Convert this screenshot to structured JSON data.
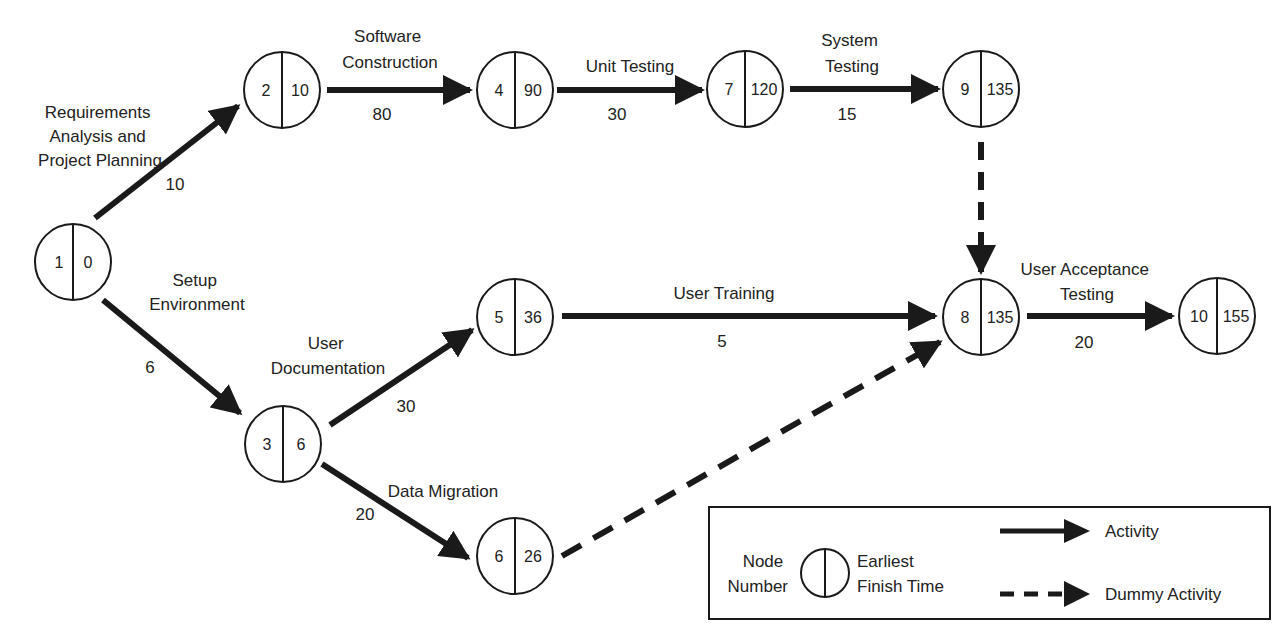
{
  "colors": {
    "ink": "#1a1a1a",
    "background": "#ffffff"
  },
  "nodes": [
    {
      "id": "1",
      "number": "1",
      "eft": "0"
    },
    {
      "id": "2",
      "number": "2",
      "eft": "10"
    },
    {
      "id": "3",
      "number": "3",
      "eft": "6"
    },
    {
      "id": "4",
      "number": "4",
      "eft": "90"
    },
    {
      "id": "5",
      "number": "5",
      "eft": "36"
    },
    {
      "id": "6",
      "number": "6",
      "eft": "26"
    },
    {
      "id": "7",
      "number": "7",
      "eft": "120"
    },
    {
      "id": "8",
      "number": "8",
      "eft": "135"
    },
    {
      "id": "9",
      "number": "9",
      "eft": "135"
    },
    {
      "id": "10",
      "number": "10",
      "eft": "155"
    }
  ],
  "activities": [
    {
      "from": "1",
      "to": "2",
      "label_lines": [
        "Requirements",
        "Analysis and",
        "Project Planning"
      ],
      "duration": "10",
      "type": "activity"
    },
    {
      "from": "1",
      "to": "3",
      "label_lines": [
        "Setup",
        "Environment"
      ],
      "duration": "6",
      "type": "activity"
    },
    {
      "from": "2",
      "to": "4",
      "label_lines": [
        "Software",
        "Construction"
      ],
      "duration": "80",
      "type": "activity"
    },
    {
      "from": "4",
      "to": "7",
      "label_lines": [
        "Unit Testing"
      ],
      "duration": "30",
      "type": "activity"
    },
    {
      "from": "7",
      "to": "9",
      "label_lines": [
        "System",
        "Testing"
      ],
      "duration": "15",
      "type": "activity"
    },
    {
      "from": "9",
      "to": "8",
      "label_lines": [],
      "duration": "",
      "type": "dummy"
    },
    {
      "from": "3",
      "to": "5",
      "label_lines": [
        "User",
        "Documentation"
      ],
      "duration": "30",
      "type": "activity"
    },
    {
      "from": "3",
      "to": "6",
      "label_lines": [
        "Data Migration"
      ],
      "duration": "20",
      "type": "activity"
    },
    {
      "from": "5",
      "to": "8",
      "label_lines": [
        "User Training"
      ],
      "duration": "5",
      "type": "activity"
    },
    {
      "from": "6",
      "to": "8",
      "label_lines": [],
      "duration": "",
      "type": "dummy"
    },
    {
      "from": "8",
      "to": "10",
      "label_lines": [
        "User Acceptance",
        "Testing"
      ],
      "duration": "20",
      "type": "activity"
    }
  ],
  "legend": {
    "node_left_lines": [
      "Node",
      "Number"
    ],
    "node_right_lines": [
      "Earliest",
      "Finish Time"
    ],
    "activity_label": "Activity",
    "dummy_label": "Dummy Activity"
  }
}
